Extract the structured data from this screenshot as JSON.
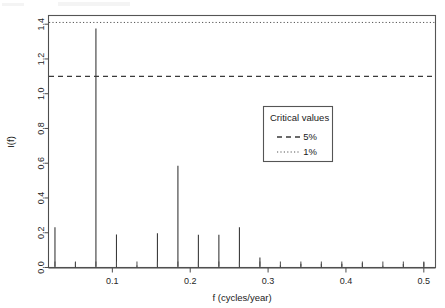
{
  "chart_data": {
    "type": "bar",
    "title": "",
    "subtitle": "",
    "xlabel": "f (cycles/year)",
    "ylabel": "I(f)",
    "xlim": [
      0.018,
      0.515
    ],
    "ylim": [
      0.0,
      1.45
    ],
    "grid": false,
    "x_ticks": [
      0.1,
      0.2,
      0.3,
      0.4,
      0.5
    ],
    "x_tick_labels": [
      "0.1",
      "0.2",
      "0.3",
      "0.4",
      "0.5"
    ],
    "y_ticks": [
      0.0,
      0.2,
      0.4,
      0.6,
      0.8,
      1.0,
      1.2,
      1.4
    ],
    "y_tick_labels": [
      "0.0",
      "0.2",
      "0.4",
      "0.6",
      "0.8",
      "1.0",
      "1.2",
      "1.4"
    ],
    "x": [
      0.0263,
      0.0526,
      0.0789,
      0.1053,
      0.1316,
      0.1579,
      0.1842,
      0.2105,
      0.2368,
      0.2632,
      0.2895,
      0.3158,
      0.3421,
      0.3684,
      0.3947,
      0.4211,
      0.4474,
      0.4737,
      0.5
    ],
    "values": [
      0.232,
      0.03,
      1.375,
      0.19,
      0.012,
      0.197,
      0.585,
      0.188,
      0.188,
      0.231,
      0.058,
      0.013,
      0.022,
      0.022,
      0.022,
      0.026,
      0.01,
      0.02,
      0.03
    ],
    "series": [
      {
        "name": "I(f)",
        "values": [
          0.232,
          0.03,
          1.375,
          0.19,
          0.012,
          0.197,
          0.585,
          0.188,
          0.188,
          0.231,
          0.058,
          0.013,
          0.022,
          0.022,
          0.022,
          0.026,
          0.01,
          0.02,
          0.03
        ]
      }
    ],
    "reference_lines": [
      {
        "name": "5%",
        "value": 1.1,
        "style": "dashed"
      },
      {
        "name": "1%",
        "value": 1.41,
        "style": "dotted"
      }
    ],
    "legend": {
      "position": "inside-right",
      "title": "Critical values",
      "entries": [
        {
          "label": "5%",
          "style": "dashed"
        },
        {
          "label": "1%",
          "style": "dotted"
        }
      ]
    }
  },
  "axes": {
    "x_title": "f (cycles/year)",
    "y_title": "I(f)"
  },
  "legend": {
    "title": "Critical values",
    "item_5pct": "5%",
    "item_1pct": "1%"
  },
  "colors": {
    "spike": "#3a3a3a",
    "axis": "#4d4d4d",
    "crit_5pct": "#3a3a3a",
    "crit_1pct": "#555555",
    "background": "#ffffff"
  }
}
